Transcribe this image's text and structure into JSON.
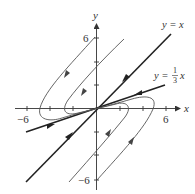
{
  "diagram": {
    "type": "phase-portrait",
    "axes": {
      "x_label": "x",
      "y_label": "y",
      "x_ticks": [
        -6,
        -4,
        -2,
        2,
        4,
        6
      ],
      "y_ticks": [
        -6,
        -4,
        -2,
        2,
        4,
        6
      ],
      "x_tick_labels": {
        "neg": "−6",
        "pos": "6"
      },
      "y_tick_labels": {
        "pos": "6",
        "neg": "−6"
      }
    },
    "lines": [
      {
        "name": "y = x",
        "label_lhs": "y",
        "label_eq": "=",
        "label_rhs": "x",
        "direction": "toward origin from upper right, away... arrows point toward origin in Q1 and away from Q3 toward origin"
      },
      {
        "name": "y = 1/3 x",
        "label_lhs": "y",
        "label_eq": "=",
        "label_num": "1",
        "label_den": "3",
        "label_rhs": "x"
      }
    ],
    "trajectories": 4,
    "colors": {
      "axis": "#333333",
      "eigenline": "#222222",
      "trajectory": "#555555",
      "background": "#ffffff"
    }
  }
}
